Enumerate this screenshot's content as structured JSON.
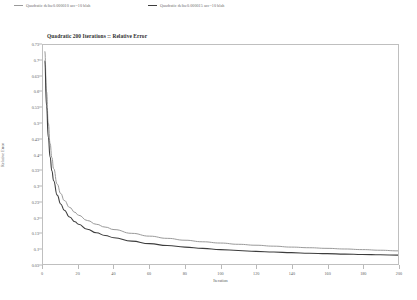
{
  "chart_data": {
    "type": "line",
    "title": "Quadratic 200 Iterations :: Relative Error",
    "xlabel": "Iteration",
    "ylabel": "Relative Error",
    "xlim": [
      0,
      200
    ],
    "ylim": [
      0.05,
      0.75
    ],
    "grid": false,
    "legend_position": "top-outside",
    "xticks": [
      0,
      20,
      40,
      60,
      80,
      100,
      120,
      140,
      160,
      180,
      200
    ],
    "xtick_labels": [
      "0",
      "20",
      "40",
      "60",
      "80",
      "100",
      "120",
      "140",
      "160",
      "180",
      "200"
    ],
    "yticks": [
      0.05,
      0.1,
      0.15,
      0.2,
      0.25,
      0.3,
      0.35,
      0.4,
      0.45,
      0.5,
      0.55,
      0.6,
      0.65,
      0.7,
      0.75
    ],
    "ytick_labels": [
      "0.05",
      "0.1",
      "0.15",
      "0.2",
      "0.25",
      "0.3",
      "0.35",
      "0.4",
      "0.45",
      "0.5",
      "0.55",
      "0.6",
      "0.65",
      "0.7",
      "0.75"
    ],
    "series": [
      {
        "name": "Quadratic delta:0.000010 acc=10 blah",
        "color": "#9a9a9a",
        "x": [
          1,
          2,
          3,
          4,
          5,
          6,
          8,
          10,
          12,
          15,
          18,
          20,
          25,
          30,
          35,
          40,
          50,
          60,
          70,
          80,
          90,
          100,
          110,
          120,
          130,
          140,
          150,
          160,
          170,
          180,
          190,
          200
        ],
        "y": [
          0.73,
          0.6,
          0.5,
          0.435,
          0.39,
          0.355,
          0.305,
          0.275,
          0.253,
          0.231,
          0.215,
          0.206,
          0.189,
          0.177,
          0.168,
          0.16,
          0.148,
          0.139,
          0.132,
          0.126,
          0.121,
          0.117,
          0.113,
          0.11,
          0.107,
          0.104,
          0.102,
          0.1,
          0.098,
          0.096,
          0.094,
          0.092
        ]
      },
      {
        "name": "Quadratic delta:0.000015 acc=10 blah",
        "color": "#3d3d3d",
        "x": [
          1,
          2,
          3,
          4,
          5,
          6,
          8,
          10,
          12,
          15,
          18,
          20,
          25,
          30,
          35,
          40,
          50,
          60,
          70,
          80,
          90,
          100,
          110,
          120,
          130,
          140,
          150,
          160,
          170,
          180,
          190,
          200
        ],
        "y": [
          0.7,
          0.555,
          0.455,
          0.392,
          0.348,
          0.316,
          0.27,
          0.242,
          0.222,
          0.2,
          0.185,
          0.177,
          0.161,
          0.15,
          0.141,
          0.134,
          0.123,
          0.115,
          0.109,
          0.104,
          0.1,
          0.096,
          0.093,
          0.0905,
          0.0882,
          0.0862,
          0.0845,
          0.083,
          0.0817,
          0.0805,
          0.0794,
          0.0785
        ]
      }
    ]
  },
  "legend": {
    "items": [
      {
        "label": "Quadratic delta:0.000010 acc=10 blah",
        "color": "#9a9a9a"
      },
      {
        "label": "Quadratic delta:0.000015 acc=10 blah",
        "color": "#3d3d3d"
      }
    ]
  }
}
